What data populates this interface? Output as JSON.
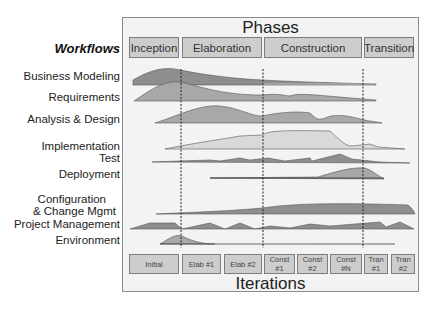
{
  "diagram": {
    "title_top": "Phases",
    "title_bottom": "Iterations",
    "workflows_heading": "Workflows",
    "phases": [
      {
        "label": "Inception"
      },
      {
        "label": "Elaboration"
      },
      {
        "label": "Construction"
      },
      {
        "label": "Transition"
      }
    ],
    "workflows": [
      {
        "label": "Business Modeling"
      },
      {
        "label": "Requirements"
      },
      {
        "label": "Analysis & Design"
      },
      {
        "label": "Implementation"
      },
      {
        "label": "Test"
      },
      {
        "label": "Deployment"
      },
      {
        "label": "Configuration"
      },
      {
        "label": "& Change Mgmt"
      },
      {
        "label": "Project Management"
      },
      {
        "label": "Environment"
      }
    ],
    "iterations": [
      {
        "label": "Initial"
      },
      {
        "label": "Elab #1"
      },
      {
        "label": "Elab #2"
      },
      {
        "label": "Const\n#1"
      },
      {
        "label": "Const\n#2"
      },
      {
        "label": "Const\n#N"
      },
      {
        "label": "Tran\n#1"
      },
      {
        "label": "Tran\n#2"
      }
    ],
    "colors": {
      "background": "#f3f3f3",
      "box_fill": "#cdcdcd",
      "hump_dark": "#8e8e8e",
      "hump_mid": "#a8a8a8",
      "hump_light": "#d9d9d9",
      "divider": "#222222"
    }
  }
}
